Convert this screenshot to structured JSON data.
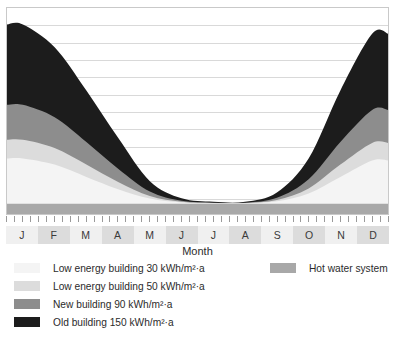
{
  "chart_data": {
    "type": "area",
    "title": "",
    "xlabel": "Month",
    "ylabel": "",
    "stacked": true,
    "grid": true,
    "gridline_count": 11,
    "legend_position": "bottom",
    "categories": [
      "J",
      "F",
      "M",
      "A",
      "M",
      "J",
      "J",
      "A",
      "S",
      "O",
      "N",
      "D"
    ],
    "x": [
      1,
      2,
      3,
      4,
      5,
      6,
      7,
      8,
      9,
      10,
      11,
      12
    ],
    "ylim": [
      0,
      100
    ],
    "series": [
      {
        "name": "Hot water system",
        "color": "#a8a8a8",
        "values": [
          5,
          5,
          5,
          5,
          5,
          5,
          5,
          5,
          5,
          5,
          5,
          5
        ]
      },
      {
        "name": "Low energy building 30 kWh/m²·a",
        "color": "#f4f4f4",
        "values": [
          22,
          19,
          13,
          7,
          2.5,
          0.6,
          0.2,
          0.2,
          1.2,
          5,
          13,
          21
        ]
      },
      {
        "name": "Low energy building 50 kWh/m²·a",
        "color": "#dcdcdc",
        "values": [
          9,
          8,
          6,
          3.5,
          1.2,
          0.3,
          0.1,
          0.1,
          0.6,
          2.4,
          6,
          8.5
        ]
      },
      {
        "name": "New building 90 kWh/m²·a",
        "color": "#8d8d8d",
        "values": [
          17,
          15,
          11,
          6.5,
          2.2,
          0.5,
          0.2,
          0.2,
          1.1,
          4.5,
          11,
          16
        ]
      },
      {
        "name": "Old building 150 kWh/m²·a",
        "color": "#1c1c1c",
        "values": [
          39,
          34,
          25,
          15,
          5,
          1.2,
          0.4,
          0.4,
          2.5,
          10,
          25,
          37
        ]
      }
    ]
  },
  "axis": {
    "x_title": "Month",
    "month_labels": [
      "J",
      "F",
      "M",
      "A",
      "M",
      "J",
      "J",
      "A",
      "S",
      "O",
      "N",
      "D"
    ],
    "tick_count": 49
  },
  "legend": {
    "left_items": [
      {
        "label": "Low energy building 30 kWh/m²·a",
        "color": "#f4f4f4"
      },
      {
        "label": "Low energy building 50 kWh/m²·a",
        "color": "#dcdcdc"
      },
      {
        "label": "New building 90 kWh/m²·a",
        "color": "#8d8d8d"
      },
      {
        "label": "Old building 150 kWh/m²·a",
        "color": "#1c1c1c"
      }
    ],
    "right_items": [
      {
        "label": "Hot water system",
        "color": "#a8a8a8"
      }
    ]
  },
  "colors": {
    "grid": "#d9d9d9",
    "frame": "#c9c9c9",
    "background": "#ffffff",
    "month_cell_shaded": "#dcdcdc",
    "month_cell_plain": "#f0f0f0",
    "tick": "#9a9a9a",
    "text": "#2b2b2b"
  }
}
